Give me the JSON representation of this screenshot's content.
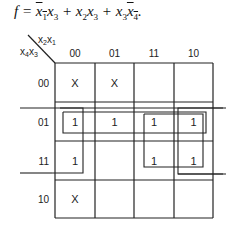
{
  "formula": {
    "lhs": "f",
    "terms": [
      {
        "vars": [
          {
            "name": "x",
            "sub": "1",
            "bar": true
          },
          {
            "name": "x",
            "sub": "3",
            "bar": false
          }
        ]
      },
      {
        "vars": [
          {
            "name": "x",
            "sub": "2",
            "bar": false
          },
          {
            "name": "x",
            "sub": "3",
            "bar": false
          }
        ]
      },
      {
        "vars": [
          {
            "name": "x",
            "sub": "3",
            "bar": false
          },
          {
            "name": "x",
            "sub": "4",
            "bar": true
          }
        ]
      }
    ]
  },
  "kmap": {
    "col_var_label": "x2x1",
    "row_var_label": "x4x3",
    "col_headers": [
      "00",
      "01",
      "11",
      "10"
    ],
    "row_headers": [
      "00",
      "01",
      "11",
      "10"
    ],
    "cells": [
      [
        "X",
        "X",
        "",
        ""
      ],
      [
        "1",
        "1",
        "1",
        "1"
      ],
      [
        "1",
        "",
        "1",
        "1"
      ],
      [
        "X",
        "",
        "",
        ""
      ]
    ],
    "groups": [
      {
        "name": "row-01-group",
        "cells": "row 01, all columns (wraps horizontally)"
      },
      {
        "name": "col-00-group",
        "cells": "column 00, rows 01 and 11 (wraps vertically with row 10 X)"
      },
      {
        "name": "cols-11-10-rows-01-11-group",
        "cells": "columns 11 and 10, rows 01 and 11"
      },
      {
        "name": "col-10-wrap-group",
        "cells": "column 10 rows 01 and 11, wrapping horizontally"
      }
    ]
  }
}
